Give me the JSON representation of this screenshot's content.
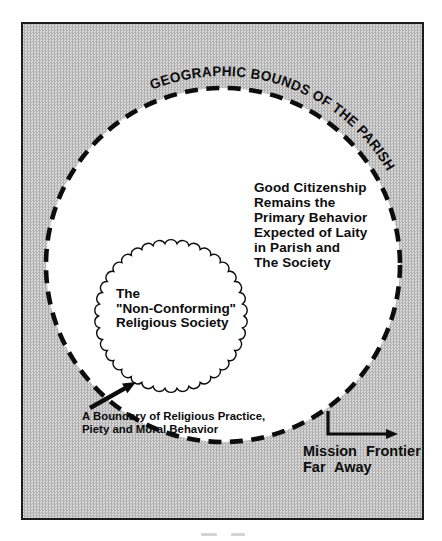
{
  "figure": {
    "arc_label": "GEOGRAPHIC BOUNDS OF THE PARISH",
    "center_text": "Good Citizenship\nRemains the\nPrimary Behavior\nExpected of Laity\nin Parish and\nThe Society",
    "society_label": "The\n\"Non-Conforming\"\nReligious Society",
    "boundary_annotation": "A Boundary of Religious Practice,\nPiety and Moral Behavior",
    "mission_label": "Mission Frontier\nFar Away",
    "colors": {
      "ink": "#0d0d0d",
      "frame_border": "#1c1c1c",
      "stipple_dark": "#b0b0b0",
      "stipple_light": "#dadada",
      "parish_fill": "#ffffff"
    },
    "shapes": {
      "parish_circle": {
        "cx": 223,
        "cy": 265,
        "r": 177,
        "dash": "13 8.5",
        "stroke_width": 4.6
      },
      "society_circle": {
        "cx": 171,
        "cy": 316,
        "r": 72.5,
        "bumps": 38,
        "bump_r": 6.4,
        "stroke_width": 1.4
      },
      "title_arc": {
        "cx": 223,
        "cy": 265,
        "r": 189,
        "start_deg": 112,
        "end_deg": 29,
        "text_length": 272
      },
      "boundary_arrow": {
        "x1": 90,
        "y1": 408,
        "x2": 136,
        "y2": 382,
        "width": 4.4,
        "head_len": 13,
        "head_w": 11
      },
      "mission_arrow": {
        "pts": [
          [
            328,
            411
          ],
          [
            328,
            434
          ],
          [
            398,
            434
          ]
        ],
        "width": 3.2,
        "head_len": 12,
        "head_w": 10
      }
    }
  }
}
